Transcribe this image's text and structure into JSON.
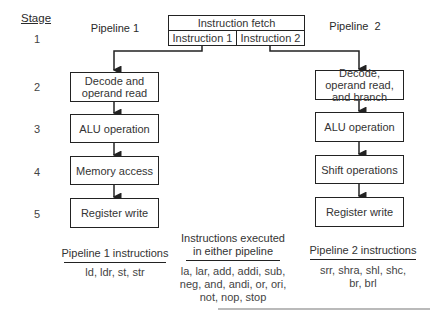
{
  "stage_header": "Stage",
  "stages": [
    "1",
    "2",
    "3",
    "4",
    "5"
  ],
  "fetch": {
    "title": "Instruction fetch",
    "slots": [
      "Instruction 1",
      "Instruction 2"
    ]
  },
  "pipeline1": {
    "label": "Pipeline 1",
    "boxes": [
      "Decode and operand read",
      "ALU operation",
      "Memory access",
      "Register write"
    ],
    "instructions_header": "Pipeline 1 instructions",
    "instructions": [
      "ld, ldr, st, str"
    ]
  },
  "pipeline2": {
    "label": "Pipeline  2",
    "boxes": [
      "Decode, operand read, and branch",
      "ALU operation",
      "Shift operations",
      "Register write"
    ],
    "instructions_header": "Pipeline 2 instructions",
    "instructions": [
      "srr, shra, shl, shc,",
      "br, brl"
    ]
  },
  "shared": {
    "header_lines": [
      "Instructions executed",
      "in either pipeline"
    ],
    "instructions": [
      "la, lar, add, addi, sub,",
      "neg, and, andi, or, ori,",
      "not, nop, stop"
    ]
  }
}
